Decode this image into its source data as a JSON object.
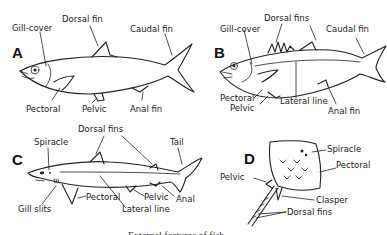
{
  "figure": {
    "caption": "External features of fish",
    "panels": [
      {
        "letter": "A",
        "labels": {
          "gill_cover": "Gill-cover",
          "dorsal": "Dorsal fin",
          "caudal": "Caudal fin",
          "pectoral": "Pectoral",
          "pelvic": "Pelvic",
          "anal": "Anal fin"
        }
      },
      {
        "letter": "B",
        "labels": {
          "gill_cover": "Gill-cover",
          "dorsal": "Dorsal fins",
          "caudal": "Caudal fin",
          "pectoral": "Pectoral",
          "pelvic": "Pelvic",
          "lateral_line": "Lateral line",
          "anal": "Anal fin"
        }
      },
      {
        "letter": "C",
        "labels": {
          "spiracle": "Spiracle",
          "dorsal": "Dorsal fins",
          "tail": "Tail",
          "gill_slits": "Gill slits",
          "pectoral": "Pectoral",
          "lateral_line": "Lateral line",
          "pelvic": "Pelvic",
          "anal": "Anal"
        }
      },
      {
        "letter": "D",
        "labels": {
          "spiracle": "Spiracle",
          "pectoral": "Pectoral",
          "pelvic": "Pelvic",
          "clasper": "Clasper",
          "dorsal": "Dorsal fins"
        }
      }
    ]
  }
}
